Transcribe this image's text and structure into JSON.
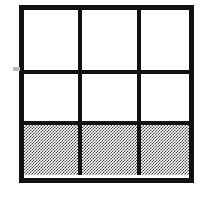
{
  "figure": {
    "type": "shaded-grid-diagram",
    "rows": 3,
    "columns": 3,
    "total_cells": 9,
    "shaded_cells": 3,
    "shaded_fraction": "3/9",
    "simplified_fraction": "1/3",
    "shaded_region": "bottom row",
    "colors": {
      "background": "#ffffff",
      "line": "#111111",
      "shading": "#9a9a9a",
      "artifact": "#b9b9b9"
    },
    "line_widths": {
      "outer_border": "5px",
      "interior_rule": "4px"
    },
    "cells": [
      {
        "id": "r1c1",
        "row": 1,
        "column": 1,
        "shaded": false,
        "fill": "white"
      },
      {
        "id": "r1c2",
        "row": 1,
        "column": 2,
        "shaded": false,
        "fill": "white"
      },
      {
        "id": "r1c3",
        "row": 1,
        "column": 3,
        "shaded": false,
        "fill": "white"
      },
      {
        "id": "r2c1",
        "row": 2,
        "column": 1,
        "shaded": false,
        "fill": "white"
      },
      {
        "id": "r2c2",
        "row": 2,
        "column": 2,
        "shaded": false,
        "fill": "white"
      },
      {
        "id": "r2c3",
        "row": 2,
        "column": 3,
        "shaded": false,
        "fill": "white"
      },
      {
        "id": "r3c1",
        "row": 3,
        "column": 1,
        "shaded": true,
        "fill": "gray-dither"
      },
      {
        "id": "r3c2",
        "row": 3,
        "column": 2,
        "shaded": true,
        "fill": "gray-dither"
      },
      {
        "id": "r3c3",
        "row": 3,
        "column": 3,
        "shaded": true,
        "fill": "gray-dither"
      }
    ]
  }
}
